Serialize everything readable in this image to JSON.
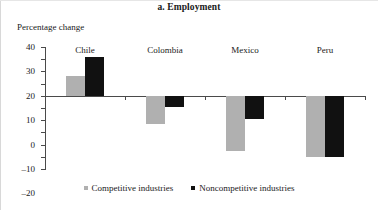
{
  "figure": {
    "panel_title": "a. Employment",
    "axis_title": "Percentage change"
  },
  "legend": {
    "items": [
      {
        "label": "Competitive industries",
        "color": "#b0b0b0",
        "marker": "square-marker"
      },
      {
        "label": "Noncompetitive industries",
        "color": "#111111",
        "marker": "square-marker"
      }
    ]
  },
  "chart_data": {
    "type": "bar",
    "title": "a. Employment",
    "xlabel": "",
    "ylabel": "Percentage change",
    "ylim": [
      -60,
      40
    ],
    "yticks": [
      40,
      30,
      20,
      10,
      0,
      -10,
      -20,
      -30,
      -40,
      -50,
      -60
    ],
    "ytick_labels": [
      "40",
      "30",
      "20",
      "10",
      "0",
      "–10",
      "–20",
      "–30",
      "–40",
      "–50",
      "–60"
    ],
    "grid": false,
    "legend_position": "bottom-center",
    "categories": [
      "Chile",
      "Colombia",
      "Mexico",
      "Peru"
    ],
    "series": [
      {
        "name": "Competitive industries",
        "color": "#b0b0b0",
        "values": [
          16,
          -23,
          -45,
          -50
        ]
      },
      {
        "name": "Noncompetitive industries",
        "color": "#111111",
        "values": [
          32,
          -9,
          -19,
          -50
        ]
      }
    ]
  }
}
